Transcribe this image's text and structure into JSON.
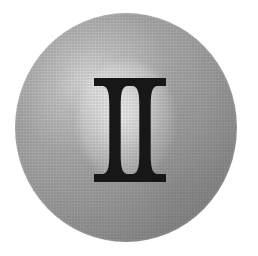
{
  "image": {
    "title": "Roman numeral two on a shaded grey disc",
    "background_color": "#ffffff",
    "width": 258,
    "height": 256
  },
  "disc": {
    "name": "grey-sphere-disc",
    "shape": "circle",
    "center_x": 126,
    "center_y": 127,
    "diameter": 224,
    "fill_light": "#b9b9b9",
    "fill_mid": "#a9a9a9",
    "fill_dark": "#888888",
    "highlight_color": "#ffffff",
    "texture": "halftone-dots"
  },
  "numeral": {
    "name": "roman-numeral-two",
    "text": "II",
    "value": "2",
    "color": "#1a1a1a",
    "style": "serif-slab",
    "left": 94,
    "top": 78,
    "width": 72,
    "height": 104
  },
  "glow": {
    "name": "specular-highlight",
    "color": "#ffffff"
  }
}
